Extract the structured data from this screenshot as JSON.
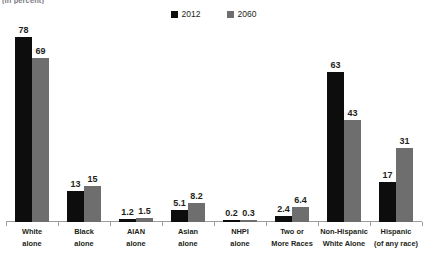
{
  "title_fragment": "(in percent)",
  "legend": {
    "position": "top-center",
    "entries": [
      {
        "label": "2012",
        "color": "#0d0d0d",
        "swatch_name": "legend-swatch-2012"
      },
      {
        "label": "2060",
        "color": "#6e6e6e",
        "swatch_name": "legend-swatch-2060"
      }
    ]
  },
  "chart_data": {
    "type": "bar",
    "title": "(in percent)",
    "xlabel": "",
    "ylabel": "",
    "ylim": [
      0,
      80
    ],
    "grid": false,
    "legend_position": "top-center",
    "categories": [
      "White alone",
      "Black alone",
      "AIAN alone",
      "Asian alone",
      "NHPI alone",
      "Two or More Races",
      "Non-Hispanic White Alone",
      "Hispanic (of any race)"
    ],
    "category_lines": [
      [
        "White",
        "alone"
      ],
      [
        "Black",
        "alone"
      ],
      [
        "AIAN",
        "alone"
      ],
      [
        "Asian",
        "alone"
      ],
      [
        "NHPI",
        "alone"
      ],
      [
        "Two or",
        "More Races"
      ],
      [
        "Non-Hispanic",
        "White Alone"
      ],
      [
        "Hispanic",
        "(of any race)"
      ]
    ],
    "series": [
      {
        "name": "2012",
        "color": "#0d0d0d",
        "values": [
          78,
          13,
          1.2,
          5.1,
          0.2,
          2.4,
          63,
          17
        ],
        "labels": [
          "78",
          "13",
          "1.2",
          "5.1",
          "0.2",
          "2.4",
          "63",
          "17"
        ]
      },
      {
        "name": "2060",
        "color": "#6e6e6e",
        "values": [
          69,
          15,
          1.5,
          8.2,
          0.3,
          6.4,
          43,
          31
        ],
        "labels": [
          "69",
          "15",
          "1.5",
          "8.2",
          "0.3",
          "6.4",
          "43",
          "31"
        ]
      }
    ]
  },
  "colors": {
    "series_2012": "#0d0d0d",
    "series_2060": "#6e6e6e",
    "axis": "#9d9d9d",
    "text": "#231f20",
    "background": "#ffffff"
  }
}
